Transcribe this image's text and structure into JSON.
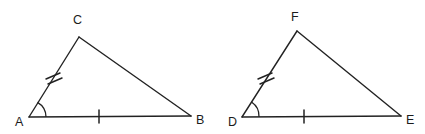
{
  "figure": {
    "background_color": "#ffffff",
    "stroke_color": "#222222",
    "label_color": "#1b1b1b",
    "triangles": [
      {
        "name": "triangle-abc",
        "vertices": {
          "A": {
            "label": "A",
            "x": 29,
            "y": 117,
            "label_x": 15,
            "label_y": 126
          },
          "B": {
            "label": "B",
            "x": 191,
            "y": 116,
            "label_x": 196,
            "label_y": 124
          },
          "C": {
            "label": "C",
            "x": 79,
            "y": 37,
            "label_x": 73,
            "label_y": 21
          }
        },
        "sides": {
          "base": {
            "name": "AB",
            "ticks": 1
          },
          "left_leg": {
            "name": "AC",
            "ticks": 2
          },
          "hypotenuse": {
            "name": "CB",
            "ticks": 0
          }
        },
        "marked_angle": {
          "at": "A",
          "arc_radius": 17
        }
      },
      {
        "name": "triangle-def",
        "vertices": {
          "D": {
            "label": "D",
            "x": 242,
            "y": 117,
            "label_x": 228,
            "label_y": 126
          },
          "E": {
            "label": "E",
            "x": 401,
            "y": 116,
            "label_x": 406,
            "label_y": 124
          },
          "F": {
            "label": "F",
            "x": 297,
            "y": 31,
            "label_x": 291,
            "label_y": 18
          }
        },
        "sides": {
          "base": {
            "name": "DE",
            "ticks": 1
          },
          "left_leg": {
            "name": "DF",
            "ticks": 2
          },
          "hypotenuse": {
            "name": "FE",
            "ticks": 0
          }
        },
        "marked_angle": {
          "at": "D",
          "arc_radius": 17
        }
      }
    ]
  }
}
